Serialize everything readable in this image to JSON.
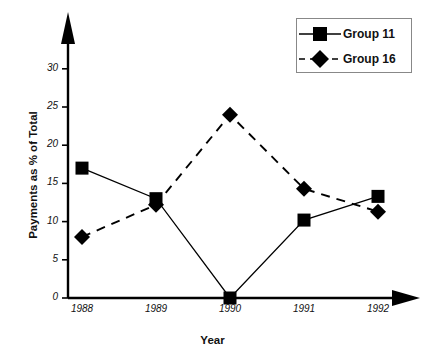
{
  "chart_data": {
    "type": "line",
    "title": "",
    "xlabel": "Year",
    "ylabel": "Payments as % of Total",
    "categories": [
      "1988",
      "1989",
      "1990",
      "1991",
      "1992"
    ],
    "x": [
      1988,
      1989,
      1990,
      1991,
      1992
    ],
    "xlim": [
      1987.6,
      1992.6
    ],
    "ylim": [
      0,
      32
    ],
    "yticks": [
      0,
      5,
      10,
      15,
      20,
      25,
      30
    ],
    "ytick_labels": [
      "0",
      "5",
      "10",
      "15",
      "20",
      "25",
      "30"
    ],
    "grid": false,
    "legend_position": "top-right",
    "series": [
      {
        "name": "Group 11",
        "marker": "square",
        "linestyle": "solid",
        "color": "#000000",
        "values": [
          17.0,
          13.0,
          0.0,
          10.2,
          13.3
        ]
      },
      {
        "name": "Group 16",
        "marker": "diamond",
        "linestyle": "dashed",
        "color": "#000000",
        "values": [
          8.0,
          12.2,
          24.0,
          14.3,
          11.3
        ]
      }
    ]
  },
  "axes": {
    "y_axis_label": "Payments as % of Total",
    "x_axis_label": "Year",
    "y_tick_labels": [
      "30",
      "25",
      "20",
      "15",
      "10",
      "5",
      "0"
    ],
    "x_tick_labels": [
      "1988",
      "1989",
      "1990",
      "1991",
      "1992"
    ]
  },
  "legend": {
    "entries": [
      {
        "label": "Group 11",
        "marker": "square-marker",
        "line": "solid-line"
      },
      {
        "label": "Group 16",
        "marker": "diamond-marker",
        "line": "dashed-line"
      }
    ]
  }
}
